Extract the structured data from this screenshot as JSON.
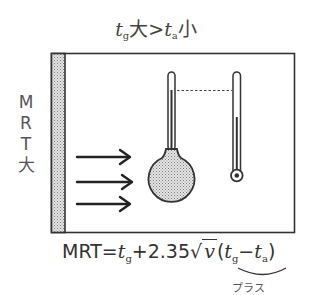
{
  "title": {
    "tg_symbol": "t",
    "tg_sub": "g",
    "tg_state": "大",
    "operator": ">",
    "ta_symbol": "t",
    "ta_sub": "a",
    "ta_state": "小"
  },
  "side_label": {
    "chars": [
      "M",
      "R",
      "T",
      "大"
    ]
  },
  "diagram": {
    "wall": {
      "pattern": "stippled",
      "fill": "#cfcfcf"
    },
    "room_box": {
      "stroke": "#333333"
    },
    "arrows": {
      "count": 3,
      "meaning": "radiant heat from wall"
    },
    "globe_thermometer": {
      "label": "globe thermometer",
      "fill": "#bdbdbd"
    },
    "dry_bulb_thermometer": {
      "label": "dry-bulb thermometer"
    },
    "comparison_line": "dotted"
  },
  "formula": {
    "lhs": "MRT",
    "equals": "=",
    "t1": "t",
    "t1_sub": "g",
    "plus": "+",
    "coef": "2.35",
    "sqrt_sign": "√",
    "v": "v",
    "open_paren": "(",
    "t2": "t",
    "t2_sub": "g",
    "minus": "−",
    "t3": "t",
    "t3_sub": "a",
    "close_paren": ")"
  },
  "brace_note": "プラス"
}
